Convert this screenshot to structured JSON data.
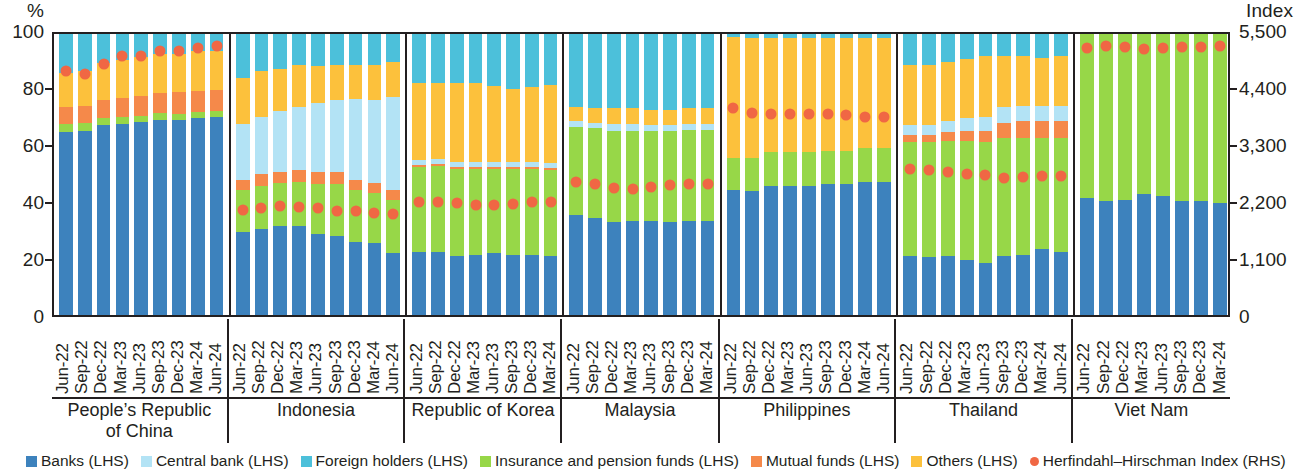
{
  "axis": {
    "left_unit": "%",
    "right_unit": "Index",
    "left_ticks": [
      "100",
      "80",
      "60",
      "40",
      "20",
      "0"
    ],
    "right_ticks": [
      "5,500",
      "4,400",
      "3,300",
      "2,200",
      "1,100",
      "0"
    ]
  },
  "legend": [
    {
      "label": "Banks (LHS)",
      "color": "#3d82bd",
      "shape": "square"
    },
    {
      "label": "Central bank (LHS)",
      "color": "#b3e3f5",
      "shape": "square"
    },
    {
      "label": "Foreign holders (LHS)",
      "color": "#4cc0da",
      "shape": "square"
    },
    {
      "label": "Insurance and pension funds (LHS)",
      "color": "#97d748",
      "shape": "square"
    },
    {
      "label": "Mutual funds (LHS)",
      "color": "#f5894a",
      "shape": "square"
    },
    {
      "label": "Others (LHS)",
      "color": "#fcc13c",
      "shape": "square"
    },
    {
      "label": "Herfindahl–Hirschman Index (RHS)",
      "color": "#f06744",
      "shape": "circle"
    }
  ],
  "chart_data": {
    "type": "bar",
    "subtype": "stacked-bar-with-scatter-overlay",
    "title": "",
    "xlabel": "",
    "ylabel": "%",
    "ylabel_right": "Index",
    "ylim": [
      0,
      100
    ],
    "ylim_right": [
      0,
      5500
    ],
    "ytick_values": [
      0,
      20,
      40,
      60,
      80,
      100
    ],
    "ytick_values_right": [
      0,
      1100,
      2200,
      3300,
      4400,
      5500
    ],
    "grid": false,
    "legend_position": "bottom",
    "series_order": [
      "Banks",
      "Insurance and pension funds",
      "Mutual funds",
      "Central bank",
      "Others",
      "Foreign holders"
    ],
    "series_colors": {
      "Banks": "#3d82bd",
      "Central bank": "#b3e3f5",
      "Foreign holders": "#4cc0da",
      "Insurance and pension funds": "#97d748",
      "Mutual funds": "#f5894a",
      "Others": "#fcc13c",
      "Herfindahl-Hirschman Index": "#f06744"
    },
    "panels": [
      {
        "name": "People's Republic\nof China",
        "name_lines": [
          "People’s Republic",
          "of China"
        ],
        "categories": [
          "Jun-22",
          "Sep-22",
          "Dec-22",
          "Mar-23",
          "Jun-23",
          "Sep-23",
          "Dec-23",
          "Mar-24",
          "Jun-24"
        ],
        "stack": [
          {
            "name": "Banks",
            "values": [
              65.0,
              65.5,
              67.5,
              68.0,
              68.5,
              69.5,
              69.5,
              70.0,
              70.5
            ]
          },
          {
            "name": "Insurance and pension funds",
            "values": [
              3.0,
              2.8,
              2.6,
              2.5,
              2.4,
              2.3,
              2.2,
              2.1,
              2.0
            ]
          },
          {
            "name": "Mutual funds",
            "values": [
              6.0,
              6.2,
              6.5,
              6.7,
              7.0,
              7.3,
              7.5,
              7.7,
              7.6
            ]
          },
          {
            "name": "Central bank",
            "values": [
              0,
              0,
              0,
              0,
              0,
              0,
              0,
              0,
              0
            ]
          },
          {
            "name": "Others",
            "values": [
              12.0,
              12.5,
              13.0,
              13.5,
              14.0,
              13.9,
              13.8,
              14.0,
              13.9
            ]
          },
          {
            "name": "Foreign holders",
            "values": [
              14.0,
              13.0,
              10.4,
              9.3,
              8.1,
              7.0,
              7.0,
              6.2,
              6.0
            ]
          }
        ],
        "hhi": [
          4700,
          4650,
          4850,
          5000,
          5000,
          5100,
          5100,
          5150,
          5200
        ]
      },
      {
        "name": "Indonesia",
        "name_lines": [
          "Indonesia"
        ],
        "categories": [
          "Jun-22",
          "Sep-22",
          "Dec-22",
          "Mar-23",
          "Jun-23",
          "Sep-23",
          "Dec-23",
          "Mar-24",
          "Jun-24"
        ],
        "stack": [
          {
            "name": "Banks",
            "values": [
              29.5,
              30.5,
              31.5,
              31.5,
              29.0,
              28.0,
              26.0,
              25.5,
              22.0
            ]
          },
          {
            "name": "Insurance and pension funds",
            "values": [
              15.0,
              15.5,
              15.5,
              16.0,
              17.5,
              18.5,
              18.5,
              18.0,
              19.0
            ]
          },
          {
            "name": "Mutual funds",
            "values": [
              3.5,
              4.0,
              4.0,
              4.0,
              4.5,
              4.5,
              3.5,
              3.5,
              3.5
            ]
          },
          {
            "name": "Central bank",
            "values": [
              20.0,
              20.5,
              21.5,
              22.5,
              24.5,
              25.5,
              29.0,
              29.5,
              33.0
            ]
          },
          {
            "name": "Others",
            "values": [
              16.5,
              16.5,
              15.0,
              15.0,
              13.0,
              12.5,
              12.0,
              12.5,
              12.5
            ]
          },
          {
            "name": "Foreign holders",
            "values": [
              15.5,
              13.0,
              12.5,
              11.0,
              11.5,
              11.0,
              11.0,
              11.0,
              10.0
            ]
          }
        ],
        "hhi": [
          2020,
          2060,
          2100,
          2080,
          2060,
          2000,
          2000,
          1960,
          1940
        ]
      },
      {
        "name": "Republic of Korea",
        "name_lines": [
          "Republic of Korea"
        ],
        "categories": [
          "Jun-22",
          "Sep-22",
          "Dec-22",
          "Mar-23",
          "Jun-23",
          "Sep-23",
          "Dec-23",
          "Mar-24"
        ],
        "stack": [
          {
            "name": "Banks",
            "values": [
              22.5,
              22.5,
              21.0,
              21.5,
              22.0,
              21.5,
              21.5,
              21.0
            ]
          },
          {
            "name": "Insurance and pension funds",
            "values": [
              30.0,
              30.5,
              31.0,
              30.5,
              30.0,
              30.5,
              30.5,
              30.5
            ]
          },
          {
            "name": "Mutual funds",
            "values": [
              0.8,
              0.8,
              0.8,
              0.8,
              0.8,
              0.8,
              0.8,
              0.8
            ]
          },
          {
            "name": "Central bank",
            "values": [
              1.7,
              1.7,
              1.7,
              1.7,
              1.7,
              1.7,
              1.7,
              1.7
            ]
          },
          {
            "name": "Others",
            "values": [
              27.5,
              27.0,
              28.0,
              28.0,
              27.0,
              26.0,
              26.5,
              28.0
            ]
          },
          {
            "name": "Foreign holders",
            "values": [
              17.5,
              17.5,
              17.5,
              17.5,
              18.5,
              19.5,
              19.0,
              18.0
            ]
          }
        ],
        "hhi": [
          2180,
          2180,
          2160,
          2120,
          2120,
          2140,
          2180,
          2180
        ]
      },
      {
        "name": "Malaysia",
        "name_lines": [
          "Malaysia"
        ],
        "categories": [
          "Jun-22",
          "Sep-22",
          "Dec-22",
          "Mar-23",
          "Jun-23",
          "Sep-23",
          "Dec-23",
          "Mar-24"
        ],
        "stack": [
          {
            "name": "Banks",
            "values": [
              35.5,
              34.5,
              33.0,
              33.5,
              33.5,
              33.0,
              33.5,
              33.5
            ]
          },
          {
            "name": "Insurance and pension funds",
            "values": [
              31.5,
              32.0,
              32.5,
              32.0,
              32.0,
              32.5,
              32.5,
              32.5
            ]
          },
          {
            "name": "Mutual funds",
            "values": [
              0,
              0,
              0,
              0,
              0,
              0,
              0,
              0
            ]
          },
          {
            "name": "Central bank",
            "values": [
              2.0,
              2.0,
              2.5,
              2.5,
              2.0,
              2.0,
              2.0,
              2.0
            ]
          },
          {
            "name": "Others",
            "values": [
              5.0,
              5.0,
              5.5,
              5.5,
              5.5,
              5.5,
              5.5,
              5.5
            ]
          },
          {
            "name": "Foreign holders",
            "values": [
              26.0,
              26.5,
              26.5,
              26.5,
              27.0,
              27.0,
              26.5,
              26.5
            ]
          }
        ],
        "hhi": [
          2560,
          2520,
          2460,
          2440,
          2480,
          2500,
          2520,
          2520
        ]
      },
      {
        "name": "Philippines",
        "name_lines": [
          "Philippines"
        ],
        "categories": [
          "Jun-22",
          "Sep-22",
          "Dec-22",
          "Mar-23",
          "Jun-23",
          "Sep-23",
          "Dec-23",
          "Mar-24",
          "Jun-24"
        ],
        "stack": [
          {
            "name": "Banks",
            "values": [
              44.5,
              44.0,
              46.0,
              46.0,
              46.0,
              46.5,
              46.5,
              47.5,
              47.5
            ]
          },
          {
            "name": "Insurance and pension funds",
            "values": [
              11.5,
              12.0,
              12.0,
              12.0,
              12.0,
              12.0,
              12.0,
              12.0,
              12.0
            ]
          },
          {
            "name": "Mutual funds",
            "values": [
              0,
              0,
              0,
              0,
              0,
              0,
              0,
              0,
              0
            ]
          },
          {
            "name": "Central bank",
            "values": [
              0,
              0,
              0,
              0,
              0,
              0,
              0,
              0,
              0
            ]
          },
          {
            "name": "Others",
            "values": [
              43.0,
              42.5,
              40.5,
              40.5,
              40.5,
              40.0,
              40.0,
              39.0,
              39.0
            ]
          },
          {
            "name": "Foreign holders",
            "values": [
              1.0,
              1.5,
              1.5,
              1.5,
              1.5,
              1.5,
              1.5,
              1.5,
              1.5
            ]
          }
        ],
        "hhi": [
          4000,
          3900,
          3880,
          3880,
          3880,
          3880,
          3860,
          3820,
          3820
        ]
      },
      {
        "name": "Thailand",
        "name_lines": [
          "Thailand"
        ],
        "categories": [
          "Jun-22",
          "Sep-22",
          "Dec-22",
          "Mar-23",
          "Jun-23",
          "Sep-23",
          "Dec-23",
          "Mar-24",
          "Jun-24"
        ],
        "stack": [
          {
            "name": "Banks",
            "values": [
              21.0,
              20.5,
              21.0,
              19.5,
              18.5,
              21.0,
              21.5,
              23.5,
              22.5
            ]
          },
          {
            "name": "Insurance and pension funds",
            "values": [
              40.5,
              41.0,
              41.0,
              42.5,
              43.0,
              42.0,
              41.5,
              39.5,
              40.5
            ]
          },
          {
            "name": "Mutual funds",
            "values": [
              2.5,
              2.5,
              3.0,
              3.5,
              4.0,
              5.5,
              6.0,
              6.0,
              6.0
            ]
          },
          {
            "name": "Central bank",
            "values": [
              3.5,
              3.5,
              4.0,
              4.5,
              5.0,
              5.5,
              5.5,
              5.5,
              5.5
            ]
          },
          {
            "name": "Others",
            "values": [
              21.5,
              21.5,
              21.0,
              21.0,
              21.5,
              18.0,
              17.5,
              17.0,
              17.5
            ]
          },
          {
            "name": "Foreign holders",
            "values": [
              11.0,
              11.0,
              10.0,
              9.0,
              8.0,
              8.0,
              8.0,
              8.5,
              8.0
            ]
          }
        ],
        "hhi": [
          2820,
          2800,
          2760,
          2720,
          2700,
          2640,
          2660,
          2680,
          2680
        ]
      },
      {
        "name": "Viet Nam",
        "name_lines": [
          "Viet Nam"
        ],
        "categories": [
          "Jun-22",
          "Sep-22",
          "Dec-22",
          "Mar-23",
          "Jun-23",
          "Sep-23",
          "Dec-23",
          "Mar-24"
        ],
        "stack": [
          {
            "name": "Banks",
            "values": [
              41.5,
              40.5,
              41.0,
              43.0,
              42.5,
              40.5,
              40.5,
              40.0
            ]
          },
          {
            "name": "Insurance and pension funds",
            "values": [
              58.5,
              59.5,
              59.0,
              57.0,
              57.5,
              59.5,
              59.5,
              60.0
            ]
          },
          {
            "name": "Mutual funds",
            "values": [
              0,
              0,
              0,
              0,
              0,
              0,
              0,
              0
            ]
          },
          {
            "name": "Central bank",
            "values": [
              0,
              0,
              0,
              0,
              0,
              0,
              0,
              0
            ]
          },
          {
            "name": "Others",
            "values": [
              0,
              0,
              0,
              0,
              0,
              0,
              0,
              0
            ]
          },
          {
            "name": "Foreign holders",
            "values": [
              0,
              0,
              0,
              0,
              0,
              0,
              0,
              0
            ]
          }
        ],
        "hhi": [
          5150,
          5200,
          5170,
          5140,
          5160,
          5180,
          5180,
          5190
        ]
      }
    ]
  }
}
